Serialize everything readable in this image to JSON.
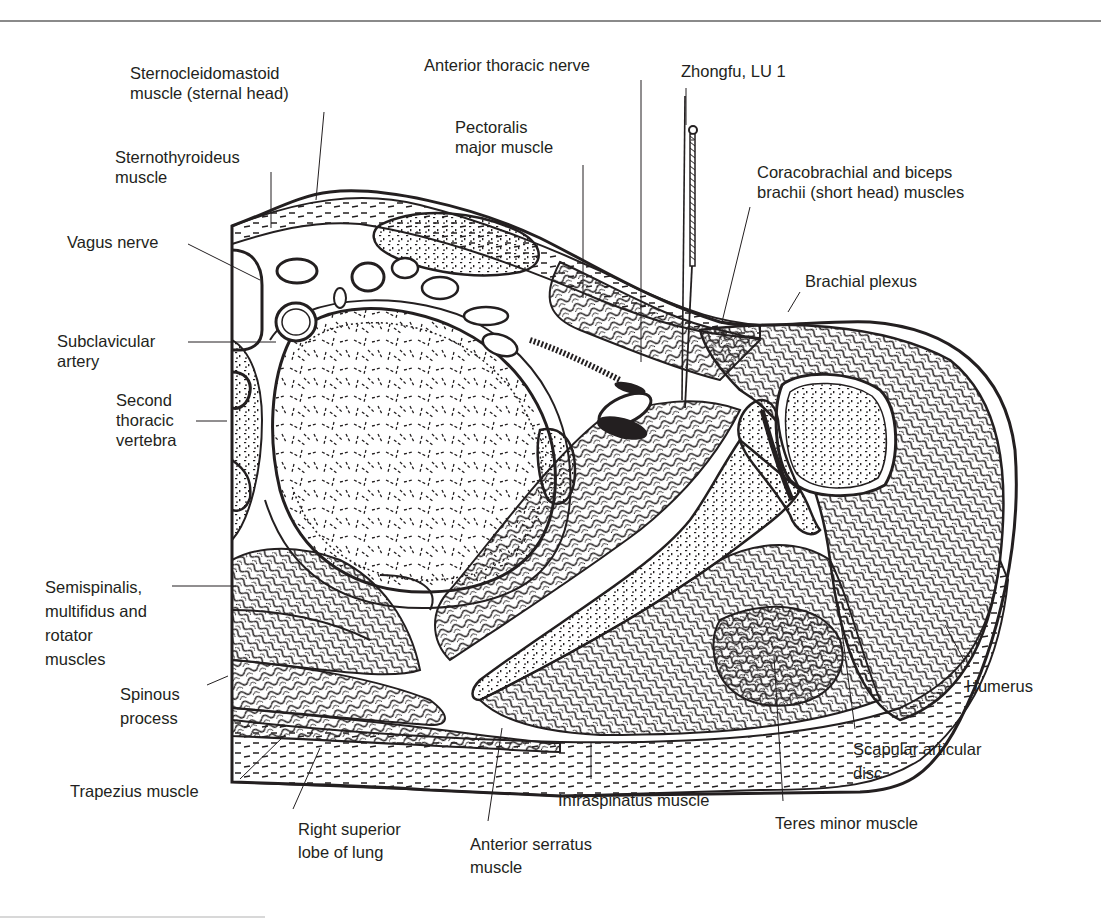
{
  "figure": {
    "colors": {
      "ink": "#231f20",
      "rule": "#8a8a8a",
      "background": "#ffffff"
    }
  },
  "labels": [
    {
      "id": "sternocleidomastoid",
      "lines": [
        "Sternocleidomastoid",
        "muscle (sternal head)"
      ]
    },
    {
      "id": "anterior-thoracic-nerve",
      "lines": [
        "Anterior thoracic nerve"
      ]
    },
    {
      "id": "zhongfu",
      "lines": [
        "Zhongfu, LU 1"
      ]
    },
    {
      "id": "pectoralis-major",
      "lines": [
        "Pectoralis",
        "major muscle"
      ]
    },
    {
      "id": "sternothyroideus",
      "lines": [
        "Sternothyroideus",
        "muscle"
      ]
    },
    {
      "id": "coracobrachial",
      "lines": [
        "Coracobrachial and biceps",
        "brachii (short head) muscles"
      ]
    },
    {
      "id": "vagus-nerve",
      "lines": [
        "Vagus nerve"
      ]
    },
    {
      "id": "brachial-plexus",
      "lines": [
        "Brachial plexus"
      ]
    },
    {
      "id": "subclavicular-artery",
      "lines": [
        "Subclavicular",
        "artery"
      ]
    },
    {
      "id": "second-thoracic-vertebra",
      "lines": [
        "Second",
        "thoracic",
        "vertebra"
      ]
    },
    {
      "id": "semispinalis",
      "lines": [
        "Semispinalis,",
        "multifidus and",
        "rotator",
        "muscles"
      ]
    },
    {
      "id": "spinous-process",
      "lines": [
        "Spinous",
        "process"
      ]
    },
    {
      "id": "humerus",
      "lines": [
        "Humerus"
      ]
    },
    {
      "id": "scapular-articular-disc",
      "lines": [
        "Scapular articular",
        "disc"
      ]
    },
    {
      "id": "trapezius",
      "lines": [
        "Trapezius muscle"
      ]
    },
    {
      "id": "infraspinatus",
      "lines": [
        "Infraspinatus muscle"
      ]
    },
    {
      "id": "teres-minor",
      "lines": [
        "Teres minor muscle"
      ]
    },
    {
      "id": "right-superior-lobe",
      "lines": [
        "Right superior",
        "lobe of lung"
      ]
    },
    {
      "id": "anterior-serratus",
      "lines": [
        "Anterior serratus",
        "muscle"
      ]
    }
  ]
}
